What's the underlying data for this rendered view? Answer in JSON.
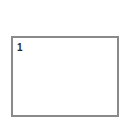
{
  "panel": {
    "number_label": "1",
    "border_color": "#8a8a8a"
  }
}
